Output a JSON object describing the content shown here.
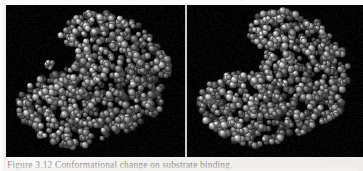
{
  "figure": {
    "caption_label": "Figure",
    "caption_number": "3.12",
    "caption_text": "Figure 3.12  Conformational change on substrate binding.",
    "panels": [
      {
        "id": "panel-left",
        "name": "open-conformation",
        "label": "",
        "state": "open",
        "background_color": "#000000",
        "molecule": {
          "render_style": "space-filling",
          "atom_color": "#b9b9b9",
          "atom_highlight_color": "#f2f2f2",
          "atom_shadow_color": "#2b2b2b",
          "atom_count": 760,
          "ligand_detached": true,
          "ligand_atom_count": 7,
          "ligand_center": [
            43,
            60
          ],
          "cleft_open": true
        }
      },
      {
        "id": "panel-right",
        "name": "closed-conformation",
        "label": "",
        "state": "closed",
        "background_color": "#000000",
        "molecule": {
          "render_style": "space-filling",
          "atom_color": "#b9b9b9",
          "atom_highlight_color": "#f2f2f2",
          "atom_shadow_color": "#2b2b2b",
          "atom_count": 790,
          "ligand_detached": false,
          "ligand_atom_count": 7,
          "ligand_center": [
            96,
            78
          ],
          "cleft_open": false
        }
      }
    ],
    "divider_color": "#cfcdc9",
    "page_background": "#f4f2f0"
  }
}
